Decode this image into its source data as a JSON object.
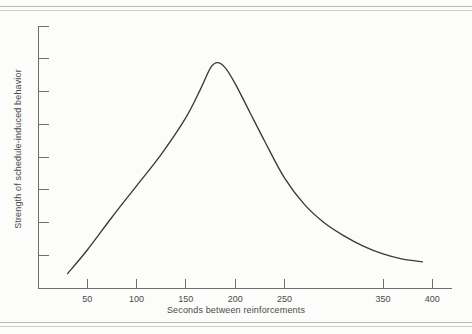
{
  "figure": {
    "background_color": "#fcfcfa",
    "curve_color": "#3a3a3a",
    "axis_color": "#6e6e6e",
    "rule_color": "#b9b9b9"
  },
  "chart_data": {
    "type": "line",
    "title": "",
    "xlabel": "Seconds between reinforcements",
    "ylabel": "Strength of schedule-induced behavior",
    "xlim": [
      0,
      420
    ],
    "ylim": [
      0,
      10
    ],
    "grid": false,
    "legend": null,
    "x_tick_labels": [
      "50",
      "100",
      "150",
      "200",
      "250",
      "350",
      "400"
    ],
    "x_tick_values": [
      50,
      100,
      150,
      200,
      250,
      350,
      400
    ],
    "y_tick_labels": [
      "",
      "",
      "",
      "",
      "",
      "",
      "",
      ""
    ],
    "y_tick_count": 8,
    "series": [
      {
        "name": "Schedule-induced behavior",
        "x": [
          30,
          50,
          75,
          100,
          125,
          150,
          165,
          175,
          182,
          190,
          200,
          215,
          230,
          250,
          270,
          290,
          310,
          330,
          350,
          370,
          390
        ],
        "values": [
          0.55,
          1.45,
          2.7,
          3.9,
          5.1,
          6.5,
          7.6,
          8.4,
          8.6,
          8.4,
          7.8,
          6.7,
          5.6,
          4.2,
          3.2,
          2.5,
          2.0,
          1.6,
          1.3,
          1.1,
          1.0
        ]
      }
    ],
    "peak": {
      "x": 182,
      "y": 8.6,
      "description": "rounded maximum near 180 seconds"
    },
    "shape_note": "inverted-U: near-linear rise to a rounded peak around 180 s, then convex decay to a low tail near 390 s"
  },
  "x_axis_title": "Seconds between reinforcements",
  "y_axis_title": "Strength of schedule-induced behavior"
}
